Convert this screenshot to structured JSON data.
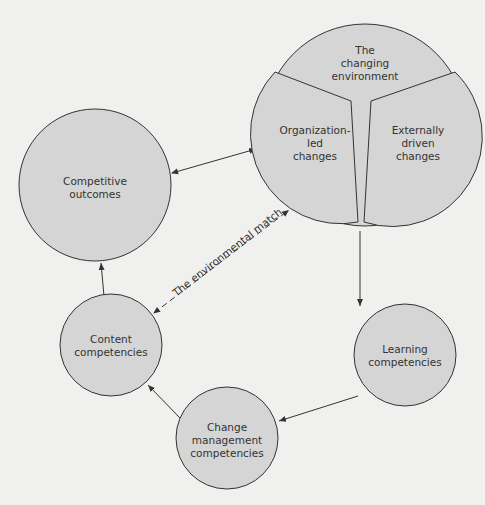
{
  "diagram": {
    "nodes": {
      "environment": {
        "title": "The changing environment",
        "line1": "The",
        "line2": "changing",
        "line3": "environment"
      },
      "org_led": {
        "line1": "Organization-",
        "line2": "led",
        "line3": "changes"
      },
      "external": {
        "line1": "Externally",
        "line2": "driven",
        "line3": "changes"
      },
      "competitive": {
        "line1": "Competitive",
        "line2": "outcomes"
      },
      "content": {
        "line1": "Content",
        "line2": "competencies"
      },
      "change_mgmt": {
        "line1": "Change",
        "line2": "management",
        "line3": "competencies"
      },
      "learning": {
        "line1": "Learning",
        "line2": "competencies"
      }
    },
    "edges": [
      {
        "from": "competitive",
        "to": "environment",
        "style": "solid",
        "bidirectional": true
      },
      {
        "from": "environment",
        "to": "learning",
        "style": "solid"
      },
      {
        "from": "learning",
        "to": "change_mgmt",
        "style": "solid"
      },
      {
        "from": "change_mgmt",
        "to": "content",
        "style": "solid"
      },
      {
        "from": "content",
        "to": "competitive",
        "style": "solid"
      },
      {
        "from": "content",
        "to": "environment",
        "style": "dashed",
        "bidirectional": true,
        "label": "The environmental match"
      }
    ],
    "colors": {
      "node_fill": "#d5d5d5",
      "stroke": "#333333",
      "background": "#f0f0ee"
    }
  }
}
